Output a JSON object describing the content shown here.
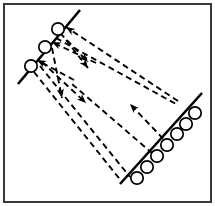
{
  "figure": {
    "background_color": "#ffffff",
    "frame": {
      "name": "figure-border",
      "x": 4,
      "y": 4,
      "width": 207,
      "height": 198,
      "stroke_color": "#3a3a3a",
      "stroke_width": 2
    },
    "line_color": "#000000",
    "dash_pattern": "6 4"
  },
  "interfaces": [
    {
      "name": "upper-left-interface",
      "label": "upper left boundary line",
      "x1": 18,
      "y1": 84,
      "x2": 80,
      "y2": 10,
      "stroke_width": 2.6
    },
    {
      "name": "lower-right-interface",
      "label": "lower right boundary line",
      "x1": 120,
      "y1": 184,
      "x2": 202,
      "y2": 93,
      "stroke_width": 2.6
    }
  ],
  "nodes": {
    "upper_left_group": {
      "name": "upper-left-circle-group",
      "count": 3,
      "radius": 6.2,
      "items": [
        {
          "name": "circle-ul-1",
          "cx": 31,
          "cy": 66
        },
        {
          "name": "circle-ul-2",
          "cx": 45,
          "cy": 47
        },
        {
          "name": "circle-ul-3",
          "cx": 58,
          "cy": 29
        }
      ]
    },
    "lower_right_group": {
      "name": "lower-right-circle-group",
      "count": 7,
      "radius": 6.2,
      "items": [
        {
          "name": "circle-lr-1",
          "cx": 137,
          "cy": 178
        },
        {
          "name": "circle-lr-2",
          "cx": 147,
          "cy": 167
        },
        {
          "name": "circle-lr-3",
          "cx": 157,
          "cy": 156
        },
        {
          "name": "circle-lr-4",
          "cx": 167,
          "cy": 145
        },
        {
          "name": "circle-lr-5",
          "cx": 177,
          "cy": 134
        },
        {
          "name": "circle-lr-6",
          "cx": 186,
          "cy": 124
        },
        {
          "name": "circle-lr-7",
          "cx": 195,
          "cy": 113
        }
      ]
    }
  },
  "flux_paths": [
    {
      "name": "flux-path-1",
      "description": "long dashed ray from lower right interface to top circle, arrow at upper left",
      "x1": 178,
      "y1": 101,
      "x2": 66,
      "y2": 27,
      "arrow_at": "end",
      "arrow_angle_deg": 213
    },
    {
      "name": "flux-path-2",
      "description": "dashed ray from mid area to second circle, arrow at upper left",
      "x1": 96,
      "y1": 63,
      "x2": 52,
      "y2": 42,
      "arrow_at": "end",
      "arrow_angle_deg": 205
    },
    {
      "name": "flux-path-3",
      "description": "dashed ray ending at first circle, arrow at upper left",
      "x1": 74,
      "y1": 80,
      "x2": 37,
      "y2": 60,
      "arrow_at": "end",
      "arrow_angle_deg": 208
    },
    {
      "name": "flux-path-4",
      "description": "dashed ray from upper left interface to mid field, arrow pointing down right",
      "x1": 60,
      "y1": 33,
      "x2": 88,
      "y2": 62,
      "arrow_at": "end",
      "arrow_angle_deg": 46
    },
    {
      "name": "flux-path-5",
      "description": "dashed ray from upper left interface downward, arrow pointing down",
      "x1": 66,
      "y1": 40,
      "x2": 88,
      "y2": 68,
      "arrow_at": "end",
      "arrow_angle_deg": 52
    },
    {
      "name": "flux-path-6",
      "description": "dashed ray from upper interface to lower left field, arrow pointing down left",
      "x1": 52,
      "y1": 48,
      "x2": 62,
      "y2": 98,
      "arrow_at": "end",
      "arrow_angle_deg": 79
    },
    {
      "name": "flux-path-7",
      "description": "dashed ray from upper interface down to mid field, arrow pointing down right",
      "x1": 42,
      "y1": 62,
      "x2": 86,
      "y2": 103,
      "arrow_at": "end",
      "arrow_angle_deg": 43
    },
    {
      "name": "flux-path-8",
      "description": "long dashed ray from upper left interface to lower right interface",
      "x1": 40,
      "y1": 66,
      "x2": 130,
      "y2": 177
    },
    {
      "name": "flux-path-9",
      "description": "long dashed ray from upper left interface to lower right interface lower portion",
      "x1": 34,
      "y1": 72,
      "x2": 122,
      "y2": 182
    },
    {
      "name": "flux-path-10",
      "description": "long dashed ray from lower right interface up to centre, arrow pointing up left",
      "x1": 170,
      "y1": 146,
      "x2": 130,
      "y2": 104,
      "arrow_at": "end",
      "arrow_angle_deg": 226
    },
    {
      "name": "flux-path-11",
      "description": "dashed ray crossing field from lower right interface toward upper left interface",
      "x1": 160,
      "y1": 160,
      "x2": 72,
      "y2": 84
    },
    {
      "name": "flux-path-12",
      "description": "dashed ray from upper left interface across to lower right interface",
      "x1": 56,
      "y1": 38,
      "x2": 176,
      "y2": 104
    }
  ]
}
